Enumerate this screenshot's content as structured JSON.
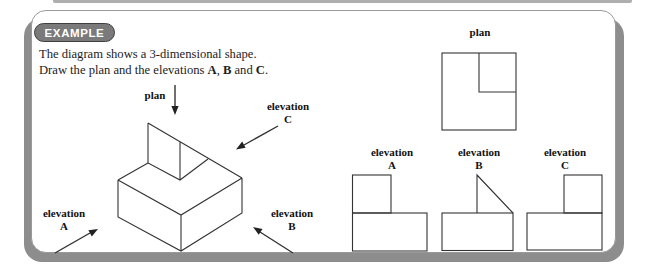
{
  "badge": {
    "label": "EXAMPLE"
  },
  "intro": {
    "line1": "The diagram shows a 3-dimensional shape.",
    "line2": {
      "part1": "Draw the plan and the elevations ",
      "bold_a": "A",
      "sep1": ", ",
      "bold_b": "B",
      "sep2": " and ",
      "bold_c": "C",
      "period": "."
    }
  },
  "iso": {
    "plan_label": "plan",
    "elevation_word": "elevation",
    "a": "A",
    "b": "B",
    "c": "C"
  },
  "views": {
    "plan_title": "plan",
    "elevation_word": "elevation",
    "a": "A",
    "b": "B",
    "c": "C"
  },
  "colors": {
    "panel_shadow": "#8d8d8d",
    "panel_border": "#999999",
    "badge_fill": "#7a7a7a",
    "badge_border": "#3f3f3f",
    "diagram_line": "#333333",
    "text": "#1c1c1c"
  }
}
